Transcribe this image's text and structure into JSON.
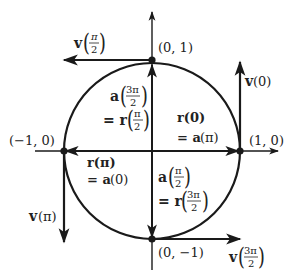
{
  "figure": {
    "colors": {
      "ink": "#1a1a1a",
      "background": "#ffffff"
    },
    "points": [
      {
        "id": "top",
        "label": "(0, 1)"
      },
      {
        "id": "right",
        "label": "(1, 0)"
      },
      {
        "id": "left",
        "label": "(−1, 0)"
      },
      {
        "id": "bottom",
        "label": "(0, −1)"
      }
    ],
    "vectors": {
      "v_pi_over_2": {
        "name": "v",
        "arg_num": "π",
        "arg_den": "2"
      },
      "v_0": {
        "name": "v",
        "arg": "(0)"
      },
      "v_pi": {
        "name": "v",
        "arg": "(π)"
      },
      "v_3pi_over_2": {
        "name": "v",
        "arg_num": "3π",
        "arg_den": "2"
      }
    },
    "equalities": {
      "a3pi2_r_pi2": {
        "line1_name": "a",
        "line1_num": "3π",
        "line1_den": "2",
        "line2_prefix": "= r",
        "line2_num": "π",
        "line2_den": "2"
      },
      "r0_api": {
        "line1": "r(0)",
        "line2_prefix": "= a",
        "line2_arg": "(π)"
      },
      "rpi_a0": {
        "line1": "r(π)",
        "line2_prefix": "= a",
        "line2_arg": "(0)"
      },
      "api2_r3pi2": {
        "line1_name": "a",
        "line1_num": "π",
        "line1_den": "2",
        "line2_prefix": "= r",
        "line2_num": "3π",
        "line2_den": "2"
      }
    }
  }
}
